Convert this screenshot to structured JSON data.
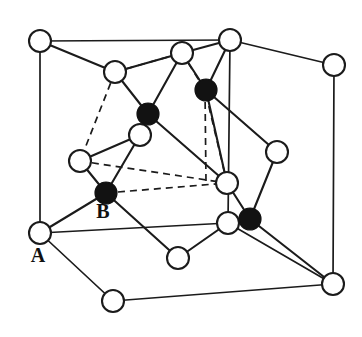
{
  "figure": {
    "background_color": "#ffffff",
    "line_color": "#1b1b1b",
    "open_atom_fill": "#ffffff",
    "filled_atom_fill": "#121212",
    "width": 362,
    "height": 337
  },
  "labels": [
    {
      "id": "label-a",
      "text": "A",
      "x": 38,
      "y": 262,
      "describes": "open-circle atom at lower-left cell corner"
    },
    {
      "id": "label-b",
      "text": "B",
      "x": 103,
      "y": 218,
      "describes": "filled-circle atom at interior lower-left"
    }
  ],
  "legend": {
    "open_circle_meaning": "A",
    "filled_circle_meaning": "B"
  },
  "chart_data": {
    "type": "scatter",
    "xlabel": "",
    "ylabel": "",
    "xlim": [
      0,
      362
    ],
    "ylim": [
      0,
      337
    ],
    "grid": false,
    "legend_position": "none",
    "series": [
      {
        "name": "A",
        "marker": "open-circle",
        "radius": 11,
        "points": [
          {
            "id": "a1",
            "x": 40,
            "y": 41
          },
          {
            "id": "a2",
            "x": 230,
            "y": 40
          },
          {
            "id": "a3",
            "x": 334,
            "y": 65
          },
          {
            "id": "a4",
            "x": 115,
            "y": 72
          },
          {
            "id": "a5",
            "x": 182,
            "y": 53
          },
          {
            "id": "a6",
            "x": 140,
            "y": 135
          },
          {
            "id": "a7",
            "x": 80,
            "y": 161
          },
          {
            "id": "a8",
            "x": 227,
            "y": 183
          },
          {
            "id": "a9",
            "x": 277,
            "y": 152
          },
          {
            "id": "a10",
            "x": 228,
            "y": 223
          },
          {
            "id": "a11",
            "x": 40,
            "y": 233
          },
          {
            "id": "a12",
            "x": 178,
            "y": 258
          },
          {
            "id": "a13",
            "x": 113,
            "y": 301
          },
          {
            "id": "a14",
            "x": 333,
            "y": 284
          }
        ]
      },
      {
        "name": "B",
        "marker": "filled-circle",
        "radius": 11,
        "points": [
          {
            "id": "b1",
            "x": 148,
            "y": 114
          },
          {
            "id": "b2",
            "x": 206,
            "y": 90
          },
          {
            "id": "b3",
            "x": 106,
            "y": 193
          },
          {
            "id": "b4",
            "x": 250,
            "y": 219
          }
        ]
      }
    ],
    "cell_edges_solid": [
      {
        "from": [
          40,
          41
        ],
        "to": [
          230,
          40
        ]
      },
      {
        "from": [
          230,
          40
        ],
        "to": [
          334,
          65
        ]
      },
      {
        "from": [
          40,
          41
        ],
        "to": [
          40,
          233
        ]
      },
      {
        "from": [
          230,
          40
        ],
        "to": [
          228,
          223
        ]
      },
      {
        "from": [
          334,
          65
        ],
        "to": [
          333,
          284
        ]
      },
      {
        "from": [
          40,
          233
        ],
        "to": [
          228,
          223
        ]
      },
      {
        "from": [
          228,
          223
        ],
        "to": [
          333,
          284
        ]
      },
      {
        "from": [
          40,
          233
        ],
        "to": [
          113,
          301
        ]
      },
      {
        "from": [
          113,
          301
        ],
        "to": [
          333,
          284
        ]
      }
    ],
    "cell_edges_dashed": [
      {
        "from": [
          115,
          72
        ],
        "to": [
          182,
          53
        ]
      },
      {
        "from": [
          182,
          53
        ],
        "to": [
          205,
          90
        ]
      },
      {
        "from": [
          115,
          72
        ],
        "to": [
          80,
          161
        ]
      },
      {
        "from": [
          80,
          161
        ],
        "to": [
          227,
          183
        ]
      },
      {
        "from": [
          227,
          183
        ],
        "to": [
          205,
          90
        ]
      },
      {
        "from": [
          205,
          90
        ],
        "to": [
          206,
          182
        ]
      },
      {
        "from": [
          106,
          193
        ],
        "to": [
          227,
          183
        ]
      }
    ],
    "bonds": [
      {
        "from": "a4",
        "to": "b1"
      },
      {
        "from": "a5",
        "to": "b1"
      },
      {
        "from": "a2",
        "to": "b2"
      },
      {
        "from": "a5",
        "to": "b2"
      },
      {
        "from": "b1",
        "to": "a6"
      },
      {
        "from": "b1",
        "to": "a8"
      },
      {
        "from": "b2",
        "to": "a9"
      },
      {
        "from": "b2",
        "to": "a8"
      },
      {
        "from": "a6",
        "to": "b3"
      },
      {
        "from": "a7",
        "to": "b3"
      },
      {
        "from": "b3",
        "to": "a11"
      },
      {
        "from": "b3",
        "to": "a12"
      },
      {
        "from": "a8",
        "to": "b4"
      },
      {
        "from": "a9",
        "to": "b4"
      },
      {
        "from": "a10",
        "to": "b4"
      },
      {
        "from": "b4",
        "to": "a14"
      },
      {
        "from": "a12",
        "to": "a10"
      },
      {
        "from": "a7",
        "to": "a6"
      },
      {
        "from": "a4",
        "to": "a1"
      },
      {
        "from": "a4",
        "to": "a5"
      },
      {
        "from": "a2",
        "to": "a5"
      }
    ]
  }
}
